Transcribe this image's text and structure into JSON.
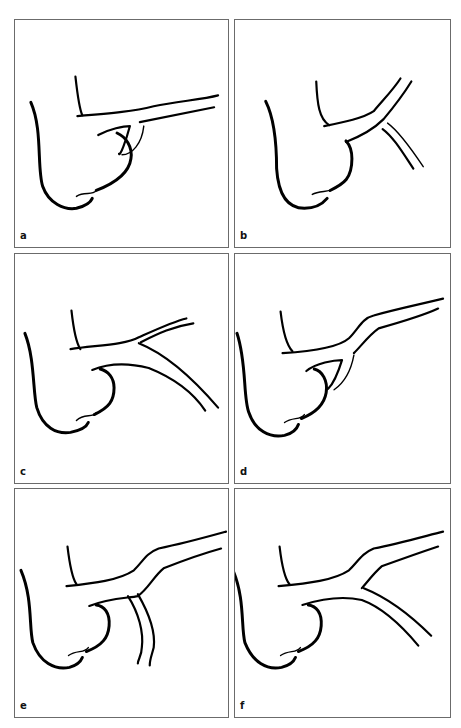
{
  "figure": {
    "panels": [
      {
        "id": "a",
        "label": "a",
        "description": "Vessel branching variant a: branch arises as a loop beneath the trunk near the bulb"
      },
      {
        "id": "b",
        "label": "b",
        "description": "Vessel branching variant b: trunk ascends steeply, branch descends to the right"
      },
      {
        "id": "c",
        "label": "c",
        "description": "Vessel branching variant c: trunk bifurcates into upper and lower branches"
      },
      {
        "id": "d",
        "label": "d",
        "description": "Vessel branching variant d: stepped trunk with small loop branch beneath"
      },
      {
        "id": "e",
        "label": "e",
        "description": "Vessel branching variant e: stepped trunk with a branch descending vertically"
      },
      {
        "id": "f",
        "label": "f",
        "description": "Vessel branching variant f: stepped trunk with a branch descending diagonally to the right"
      }
    ],
    "colors": {
      "stroke": "#000000",
      "border": "#6b6b6b",
      "background": "#ffffff"
    }
  }
}
